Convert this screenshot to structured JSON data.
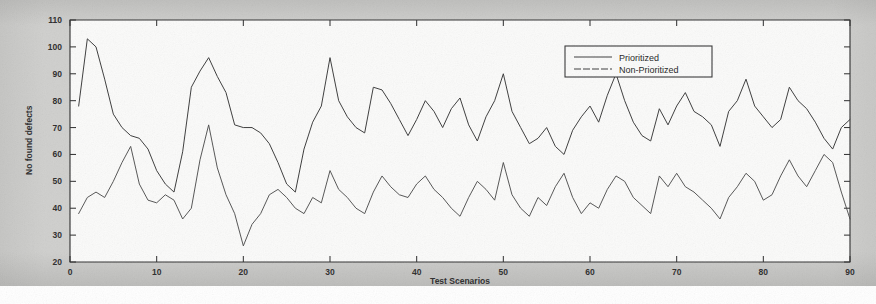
{
  "figure": {
    "name": "defects-line-chart",
    "background_color": "#cfcfcd",
    "plot_background_color": "#fbfbfa",
    "ink_color": "#3a3a3a"
  },
  "chart_data": {
    "type": "line",
    "title": "",
    "subtitle": "",
    "xlabel": "Test Scenarios",
    "ylabel": "No found defects",
    "xlim": [
      0,
      90
    ],
    "ylim": [
      20,
      110
    ],
    "xticks": [
      0,
      10,
      20,
      30,
      40,
      50,
      60,
      70,
      80,
      90
    ],
    "yticks": [
      20,
      30,
      40,
      50,
      60,
      70,
      80,
      90,
      100,
      110
    ],
    "grid": false,
    "legend_position": "top-center-right",
    "legend_entries": [
      "Prioritized",
      "Non-Prioritized"
    ],
    "x": [
      1,
      2,
      3,
      4,
      5,
      6,
      7,
      8,
      9,
      10,
      11,
      12,
      13,
      14,
      15,
      16,
      17,
      18,
      19,
      20,
      21,
      22,
      23,
      24,
      25,
      26,
      27,
      28,
      29,
      30,
      31,
      32,
      33,
      34,
      35,
      36,
      37,
      38,
      39,
      40,
      41,
      42,
      43,
      44,
      45,
      46,
      47,
      48,
      49,
      50,
      51,
      52,
      53,
      54,
      55,
      56,
      57,
      58,
      59,
      60,
      61,
      62,
      63,
      64,
      65,
      66,
      67,
      68,
      69,
      70,
      71,
      72,
      73,
      74,
      75,
      76,
      77,
      78,
      79,
      80,
      81,
      82,
      83,
      84,
      85,
      86,
      87,
      88,
      89,
      90
    ],
    "series": [
      {
        "name": "Prioritized",
        "values": [
          78,
          103,
          100,
          88,
          75,
          70,
          67,
          66,
          62,
          54,
          49,
          46,
          61,
          85,
          91,
          96,
          89,
          83,
          71,
          70,
          70,
          68,
          64,
          57,
          49,
          46,
          62,
          72,
          78,
          96,
          80,
          74,
          70,
          68,
          85,
          84,
          79,
          73,
          67,
          73,
          80,
          76,
          70,
          77,
          81,
          71,
          65,
          74,
          80,
          90,
          76,
          70,
          64,
          66,
          70,
          63,
          60,
          69,
          74,
          78,
          72,
          82,
          90,
          80,
          72,
          67,
          65,
          77,
          71,
          78,
          83,
          76,
          74,
          71,
          63,
          76,
          80,
          88,
          78,
          74,
          70,
          73,
          85,
          80,
          77,
          72,
          66,
          62,
          70,
          73
        ]
      },
      {
        "name": "Non-Prioritized",
        "values": [
          38,
          44,
          46,
          44,
          50,
          57,
          63,
          49,
          43,
          42,
          45,
          43,
          36,
          40,
          58,
          71,
          55,
          45,
          38,
          26,
          34,
          38,
          45,
          47,
          44,
          40,
          38,
          44,
          42,
          54,
          47,
          44,
          40,
          38,
          46,
          52,
          48,
          45,
          44,
          49,
          52,
          47,
          44,
          40,
          37,
          44,
          50,
          47,
          43,
          57,
          45,
          40,
          37,
          44,
          41,
          48,
          53,
          44,
          38,
          42,
          40,
          47,
          52,
          50,
          44,
          41,
          38,
          52,
          48,
          53,
          48,
          46,
          43,
          40,
          36,
          44,
          48,
          53,
          50,
          43,
          45,
          52,
          58,
          52,
          48,
          54,
          60,
          57,
          46,
          36
        ]
      }
    ]
  }
}
